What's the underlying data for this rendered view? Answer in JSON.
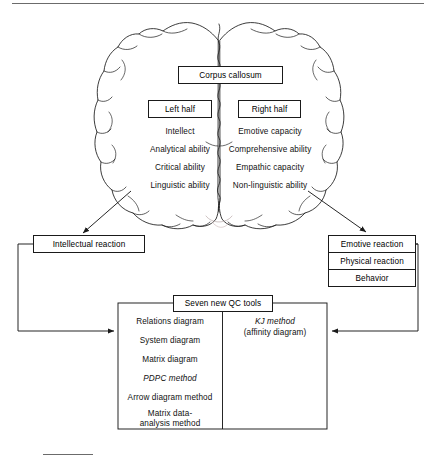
{
  "figure": {
    "title_rule_top": "horizontal-rule",
    "title_rule_bottom": "short-rule"
  },
  "brain": {
    "icon": "brain-outline-top-view",
    "corpus_callosum": "Corpus callosum",
    "left": {
      "header": "Left half",
      "traits": [
        "Intellect",
        "Analytical ability",
        "Critical ability",
        "Linguistic ability"
      ]
    },
    "right": {
      "header": "Right half",
      "traits": [
        "Emotive capacity",
        "Comprehensive ability",
        "Empathic capacity",
        "Non-linguistic ability"
      ]
    }
  },
  "reactions": {
    "left": "Intellectual reaction",
    "right": [
      "Emotive reaction",
      "Physical reaction",
      "Behavior"
    ]
  },
  "qc_tools": {
    "header": "Seven new QC tools",
    "left_column": [
      {
        "text": "Relations  diagram",
        "italic_prefix": ""
      },
      {
        "text": "System diagram",
        "italic_prefix": ""
      },
      {
        "text": "Matrix diagram",
        "italic_prefix": ""
      },
      {
        "text": "PDPC method",
        "italic_prefix": "PDPC"
      },
      {
        "text": "Arrow diagram method",
        "italic_prefix": ""
      },
      {
        "text": "Matrix data-",
        "italic_prefix": ""
      },
      {
        "text": "analysis method",
        "italic_prefix": ""
      }
    ],
    "right_column": {
      "line1": "KJ method",
      "line2": "(affinity diagram)"
    }
  },
  "colors": {
    "ink": "#1a1a1a",
    "paper": "#ffffff",
    "rule": "#6b6b6b"
  }
}
